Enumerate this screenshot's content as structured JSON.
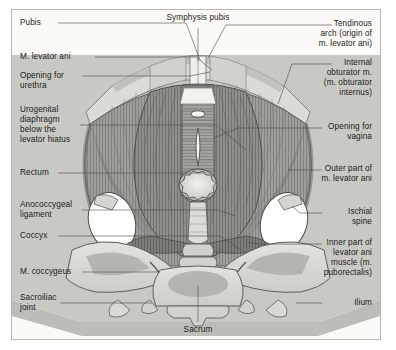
{
  "figure": {
    "background_color": "#fbfaf7",
    "frame_color": "#b9b7b2",
    "backdrop_color": "#c9c9c4",
    "muscle_color": "#9a9a9a",
    "bone_color": "#d9d8d3",
    "text_color": "#1b1b1b"
  },
  "labels": {
    "left": [
      {
        "id": "pubis",
        "text": "Pubis"
      },
      {
        "id": "m-levator-ani",
        "text": "M. levator ani"
      },
      {
        "id": "opening-for-urethra",
        "text": "Opening for\nurethra"
      },
      {
        "id": "urogenital-diaphragm",
        "text": "Urogenital\ndiaphragm\nbelow the\nlevator hiatus"
      },
      {
        "id": "rectum",
        "text": "Rectum"
      },
      {
        "id": "anococcygeal-ligament",
        "text": "Anococcygeal\nligament"
      },
      {
        "id": "coccyx",
        "text": "Coccyx"
      },
      {
        "id": "m-coccygeus",
        "text": "M. coccygeus"
      },
      {
        "id": "sacroiliac-joint",
        "text": "Sacroiliac\njoint"
      }
    ],
    "right": [
      {
        "id": "tendinous-arch",
        "text": "Tendinous\narch (origin of\nm. levator ani)"
      },
      {
        "id": "internal-obturator",
        "text": "Internal\nobturator m.\n(m. obturator\ninternus)"
      },
      {
        "id": "opening-for-vagina",
        "text": "Opening for\nvagina"
      },
      {
        "id": "outer-part-levator-ani",
        "text": "Outer part of\nm. levator ani"
      },
      {
        "id": "ischial-spine",
        "text": "Ischial\nspine"
      },
      {
        "id": "inner-part-levator-ani",
        "text": "Inner part of\nlevator ani\nmuscle (m.\npuborectalis)"
      },
      {
        "id": "ilium",
        "text": "Ilium"
      }
    ],
    "top": [
      {
        "id": "symphysis-pubis",
        "text": "Symphysis pubis"
      }
    ],
    "bottom": [
      {
        "id": "sacrum",
        "text": "Sacrum"
      }
    ]
  }
}
